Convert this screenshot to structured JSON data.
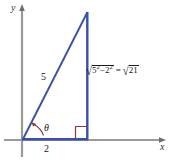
{
  "figure": {
    "type": "right-triangle-diagram",
    "axes": {
      "x_label": "x",
      "y_label": "y",
      "origin_x": 22,
      "origin_y": 140
    },
    "triangle": {
      "vertices": {
        "origin": [
          22,
          140
        ],
        "right_angle": [
          88,
          140
        ],
        "apex": [
          88,
          12
        ]
      },
      "stroke_color": "#3a4fa8",
      "right_angle_color": "#8b3a3a"
    },
    "labels": {
      "hypotenuse": "5",
      "base": "2",
      "angle": "θ",
      "leg_radicand_a": "5",
      "leg_exp_a": "2",
      "leg_minus": "−",
      "leg_radicand_b": "2",
      "leg_exp_b": "2",
      "leg_equals": "=",
      "leg_result": "21",
      "surd": "√"
    },
    "colors": {
      "axis": "#9a9a9a",
      "triangle": "#3a4fa8",
      "angle_mark": "#8b3a3a",
      "text": "#1a1a1a",
      "background": "#ffffff"
    }
  }
}
